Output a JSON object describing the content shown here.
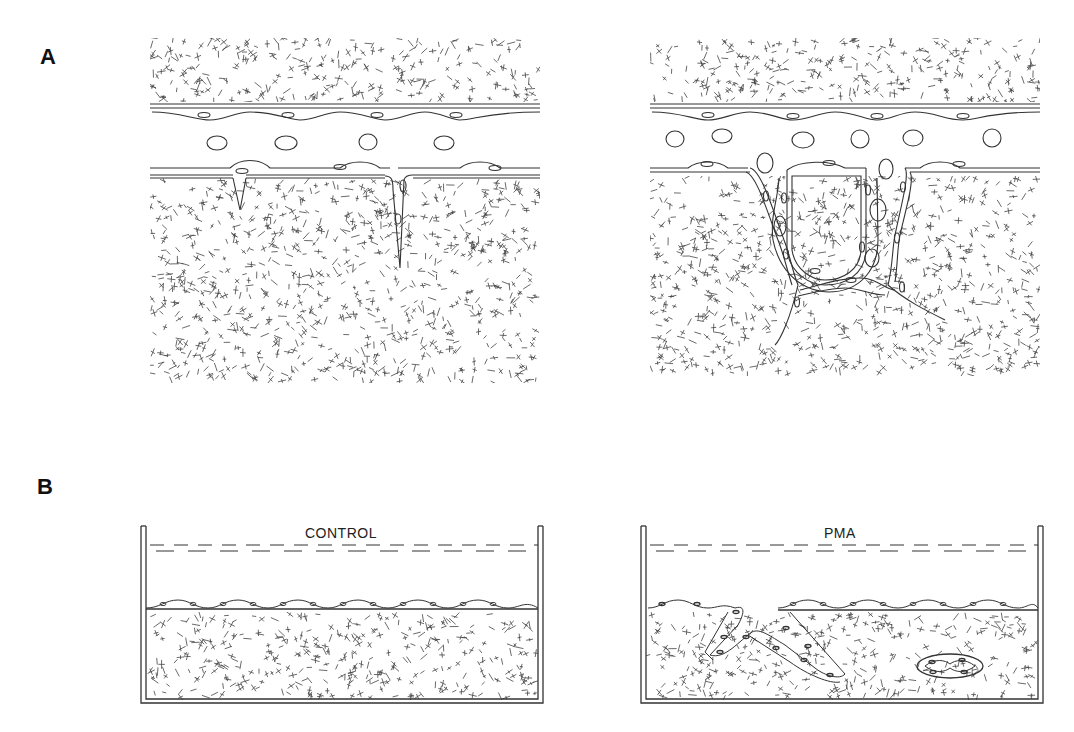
{
  "figure": {
    "panels": [
      {
        "id": "A",
        "label": "A",
        "description": "Cross-section of vessel wall: left shows endothelial cells with small invaginations into matrix; right shows endothelial cells invading matrix forming capillary-like tube"
      },
      {
        "id": "B",
        "label": "B",
        "description": "Culture dishes with endothelial monolayer on collagen gel"
      }
    ],
    "dishes": [
      {
        "id": "control",
        "label": "CONTROL"
      },
      {
        "id": "pma",
        "label": "PMA"
      }
    ]
  }
}
